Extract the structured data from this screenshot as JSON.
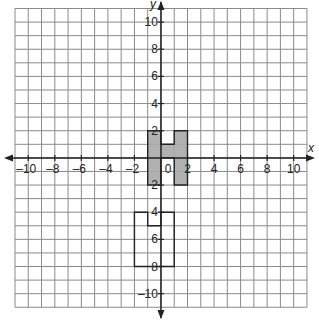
{
  "figure": {
    "type": "coordinate-plane",
    "x_axis_label": "x",
    "y_axis_label": "y",
    "x_range": [
      -11,
      11
    ],
    "y_range": [
      -11,
      11
    ],
    "grid_step": 1,
    "tick_labels_x": [
      "-10",
      "-8",
      "-6",
      "-4",
      "-2",
      "0",
      "2",
      "4",
      "6",
      "8",
      "10"
    ],
    "tick_values_x": [
      -10,
      -8,
      -6,
      -4,
      -2,
      0,
      2,
      4,
      6,
      8,
      10
    ],
    "tick_labels_y": [
      "10",
      "8",
      "6",
      "4",
      "2",
      "2",
      "4",
      "6",
      "8",
      "-10"
    ],
    "tick_values_y": [
      10,
      8,
      6,
      4,
      2,
      -2,
      -4,
      -6,
      -8,
      -10
    ],
    "colors": {
      "grid": "#8a8a8a",
      "axis": "#222222",
      "shaded_fill": "#a8a8a8",
      "outline": "#222222",
      "background": "#ffffff"
    }
  },
  "shapes": [
    {
      "name": "shaded-h-figure",
      "fill": "gray",
      "polygon": [
        [
          -1,
          -2
        ],
        [
          -1,
          2
        ],
        [
          0,
          2
        ],
        [
          0,
          1
        ],
        [
          1,
          1
        ],
        [
          1,
          2
        ],
        [
          2,
          2
        ],
        [
          2,
          -2
        ],
        [
          1,
          -2
        ],
        [
          1,
          0
        ],
        [
          0,
          0
        ],
        [
          0,
          -2
        ]
      ]
    },
    {
      "name": "outlined-figure",
      "fill": "none",
      "polygon": [
        [
          -2,
          -8
        ],
        [
          -2,
          -4
        ],
        [
          -1,
          -4
        ],
        [
          -1,
          -5
        ],
        [
          0,
          -5
        ],
        [
          0,
          -4
        ],
        [
          1,
          -4
        ],
        [
          1,
          -8
        ]
      ]
    }
  ]
}
